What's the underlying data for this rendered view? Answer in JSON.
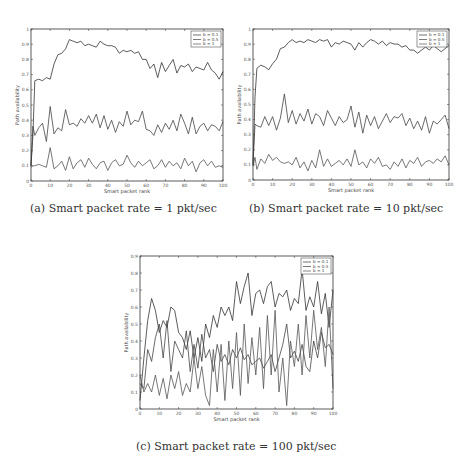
{
  "figures": [
    {
      "id": "a",
      "caption": "(a) Smart packet rate = 1 pkt/sec"
    },
    {
      "id": "b",
      "caption": "(b) Smart packet rate = 10 pkt/sec"
    },
    {
      "id": "c",
      "caption": "(c) Smart packet rate = 100 pkt/sec"
    }
  ],
  "chart_data": [
    {
      "type": "line",
      "title": "(a) Smart packet rate = 1 pkt/sec",
      "xlabel": "Smart packet rank",
      "ylabel": "Path availability",
      "xlim": [
        0,
        100
      ],
      "ylim": [
        0,
        1
      ],
      "xticks": [
        0,
        10,
        20,
        30,
        40,
        50,
        60,
        70,
        80,
        90,
        100
      ],
      "yticks": [
        0,
        0.1,
        0.2,
        0.3,
        0.4,
        0.5,
        0.6,
        0.7,
        0.8,
        0.9,
        1
      ],
      "grid": false,
      "legend_position": "upper right",
      "x": [
        0,
        1,
        2,
        4,
        6,
        8,
        10,
        12,
        14,
        16,
        18,
        20,
        22,
        24,
        26,
        28,
        30,
        32,
        34,
        36,
        38,
        40,
        42,
        44,
        46,
        48,
        50,
        52,
        54,
        56,
        58,
        60,
        62,
        64,
        66,
        68,
        70,
        72,
        74,
        76,
        78,
        80,
        82,
        84,
        86,
        88,
        90,
        92,
        94,
        96,
        98,
        100
      ],
      "series": [
        {
          "name": "b = 0.1",
          "values": [
            0.1,
            0.3,
            0.66,
            0.67,
            0.66,
            0.68,
            0.67,
            0.77,
            0.83,
            0.84,
            0.87,
            0.93,
            0.92,
            0.91,
            0.92,
            0.89,
            0.9,
            0.89,
            0.88,
            0.92,
            0.9,
            0.89,
            0.89,
            0.88,
            0.84,
            0.86,
            0.85,
            0.86,
            0.84,
            0.85,
            0.8,
            0.8,
            0.74,
            0.77,
            0.68,
            0.78,
            0.72,
            0.76,
            0.8,
            0.71,
            0.76,
            0.75,
            0.77,
            0.72,
            0.75,
            0.74,
            0.73,
            0.78,
            0.73,
            0.71,
            0.67,
            0.72
          ]
        },
        {
          "name": "b = 0.5",
          "values": [
            0.1,
            0.36,
            0.3,
            0.35,
            0.38,
            0.26,
            0.49,
            0.31,
            0.35,
            0.33,
            0.47,
            0.37,
            0.38,
            0.36,
            0.41,
            0.38,
            0.43,
            0.38,
            0.44,
            0.35,
            0.43,
            0.34,
            0.4,
            0.32,
            0.39,
            0.36,
            0.46,
            0.37,
            0.4,
            0.39,
            0.46,
            0.34,
            0.33,
            0.3,
            0.37,
            0.32,
            0.38,
            0.34,
            0.4,
            0.33,
            0.44,
            0.38,
            0.31,
            0.42,
            0.31,
            0.36,
            0.38,
            0.33,
            0.37,
            0.36,
            0.33,
            0.39
          ]
        },
        {
          "name": "b = 1",
          "values": [
            0.09,
            0.1,
            0.1,
            0.11,
            0.1,
            0.09,
            0.22,
            0.08,
            0.1,
            0.13,
            0.07,
            0.16,
            0.08,
            0.12,
            0.14,
            0.09,
            0.15,
            0.11,
            0.08,
            0.12,
            0.13,
            0.07,
            0.12,
            0.14,
            0.1,
            0.11,
            0.17,
            0.12,
            0.09,
            0.13,
            0.1,
            0.12,
            0.14,
            0.08,
            0.1,
            0.14,
            0.09,
            0.13,
            0.1,
            0.12,
            0.08,
            0.15,
            0.1,
            0.13,
            0.06,
            0.12,
            0.14,
            0.1,
            0.13,
            0.09,
            0.1,
            0.09
          ]
        }
      ]
    },
    {
      "type": "line",
      "title": "(b) Smart packet rate = 10 pkt/sec",
      "xlabel": "Smart packet rank",
      "ylabel": "Path availability",
      "xlim": [
        0,
        100
      ],
      "ylim": [
        0,
        1
      ],
      "xticks": [
        0,
        10,
        20,
        30,
        40,
        50,
        60,
        70,
        80,
        90,
        100
      ],
      "yticks": [
        0,
        0.1,
        0.2,
        0.3,
        0.4,
        0.5,
        0.6,
        0.7,
        0.8,
        0.9,
        1
      ],
      "grid": false,
      "legend_position": "upper right",
      "x": [
        0,
        1,
        2,
        4,
        6,
        8,
        10,
        12,
        14,
        16,
        18,
        20,
        22,
        24,
        26,
        28,
        30,
        32,
        34,
        36,
        38,
        40,
        42,
        44,
        46,
        48,
        50,
        52,
        54,
        56,
        58,
        60,
        62,
        64,
        66,
        68,
        70,
        72,
        74,
        76,
        78,
        80,
        82,
        84,
        86,
        88,
        90,
        92,
        94,
        96,
        98,
        100
      ],
      "series": [
        {
          "name": "b = 0.1",
          "values": [
            0.1,
            0.55,
            0.74,
            0.76,
            0.75,
            0.73,
            0.77,
            0.8,
            0.87,
            0.88,
            0.91,
            0.93,
            0.91,
            0.92,
            0.91,
            0.93,
            0.92,
            0.91,
            0.93,
            0.92,
            0.93,
            0.88,
            0.91,
            0.9,
            0.92,
            0.91,
            0.9,
            0.86,
            0.91,
            0.88,
            0.91,
            0.93,
            0.92,
            0.9,
            0.92,
            0.89,
            0.91,
            0.9,
            0.9,
            0.88,
            0.89,
            0.86,
            0.86,
            0.84,
            0.86,
            0.88,
            0.86,
            0.89,
            0.87,
            0.85,
            0.87,
            0.89
          ]
        },
        {
          "name": "b = 0.5",
          "values": [
            0.1,
            0.37,
            0.36,
            0.35,
            0.42,
            0.36,
            0.42,
            0.33,
            0.41,
            0.57,
            0.38,
            0.46,
            0.37,
            0.44,
            0.39,
            0.47,
            0.37,
            0.44,
            0.42,
            0.36,
            0.46,
            0.41,
            0.36,
            0.42,
            0.38,
            0.4,
            0.49,
            0.35,
            0.45,
            0.31,
            0.43,
            0.36,
            0.42,
            0.34,
            0.39,
            0.44,
            0.38,
            0.42,
            0.41,
            0.44,
            0.36,
            0.41,
            0.34,
            0.39,
            0.33,
            0.42,
            0.31,
            0.39,
            0.37,
            0.4,
            0.43,
            0.34
          ]
        },
        {
          "name": "b = 1",
          "values": [
            0.09,
            0.15,
            0.07,
            0.14,
            0.11,
            0.17,
            0.13,
            0.15,
            0.12,
            0.11,
            0.12,
            0.1,
            0.15,
            0.08,
            0.12,
            0.06,
            0.13,
            0.08,
            0.2,
            0.09,
            0.14,
            0.09,
            0.11,
            0.13,
            0.1,
            0.14,
            0.09,
            0.2,
            0.1,
            0.12,
            0.08,
            0.14,
            0.11,
            0.15,
            0.09,
            0.1,
            0.07,
            0.12,
            0.09,
            0.14,
            0.08,
            0.13,
            0.11,
            0.15,
            0.09,
            0.12,
            0.13,
            0.11,
            0.14,
            0.12,
            0.16,
            0.1
          ]
        }
      ]
    },
    {
      "type": "line",
      "title": "(c) Smart packet rate = 100 pkt/sec",
      "xlabel": "Smart packet rank",
      "ylabel": "Path availability",
      "xlim": [
        0,
        100
      ],
      "ylim": [
        0,
        0.9
      ],
      "xticks": [
        0,
        10,
        20,
        30,
        40,
        50,
        60,
        70,
        80,
        90,
        100
      ],
      "yticks": [
        0,
        0.1,
        0.2,
        0.3,
        0.4,
        0.5,
        0.6,
        0.7,
        0.8,
        0.9
      ],
      "grid": false,
      "legend_position": "upper right",
      "x": [
        0,
        2,
        4,
        6,
        8,
        10,
        12,
        14,
        16,
        18,
        20,
        22,
        24,
        26,
        28,
        30,
        32,
        34,
        36,
        38,
        40,
        42,
        44,
        46,
        48,
        50,
        52,
        54,
        56,
        58,
        60,
        62,
        64,
        66,
        68,
        70,
        72,
        74,
        76,
        78,
        80,
        82,
        84,
        86,
        88,
        90,
        92,
        94,
        96,
        98,
        100
      ],
      "series": [
        {
          "name": "b = 0.1",
          "values": [
            0.05,
            0.3,
            0.52,
            0.65,
            0.58,
            0.45,
            0.52,
            0.48,
            0.6,
            0.58,
            0.45,
            0.42,
            0.35,
            0.46,
            0.3,
            0.42,
            0.28,
            0.5,
            0.42,
            0.55,
            0.48,
            0.6,
            0.55,
            0.6,
            0.52,
            0.75,
            0.62,
            0.72,
            0.8,
            0.55,
            0.68,
            0.7,
            0.62,
            0.72,
            0.75,
            0.6,
            0.68,
            0.66,
            0.7,
            0.58,
            0.65,
            0.62,
            0.82,
            0.58,
            0.66,
            0.6,
            0.75,
            0.56,
            0.68,
            0.48,
            0.7
          ]
        },
        {
          "name": "b = 0.5",
          "values": [
            0.15,
            0.12,
            0.35,
            0.28,
            0.42,
            0.5,
            0.3,
            0.52,
            0.22,
            0.4,
            0.35,
            0.3,
            0.46,
            0.22,
            0.38,
            0.24,
            0.44,
            0.3,
            0.35,
            0.22,
            0.38,
            0.28,
            0.32,
            0.26,
            0.35,
            0.3,
            0.36,
            0.29,
            0.32,
            0.26,
            0.28,
            0.3,
            0.24,
            0.28,
            0.32,
            0.22,
            0.3,
            0.38,
            0.5,
            0.3,
            0.34,
            0.28,
            0.38,
            0.25,
            0.22,
            0.4,
            0.3,
            0.45,
            0.36,
            0.38,
            0.32
          ]
        },
        {
          "name": "b = 1",
          "values": [
            0.2,
            0.1,
            0.15,
            0.1,
            0.2,
            0.08,
            0.18,
            0.06,
            0.2,
            0.12,
            0.22,
            0.08,
            0.15,
            0.1,
            0.3,
            0.12,
            0.25,
            0.08,
            0.02,
            0.35,
            0.1,
            0.38,
            0.05,
            0.4,
            0.12,
            0.45,
            0.08,
            0.5,
            0.15,
            0.42,
            0.2,
            0.48,
            0.12,
            0.55,
            0.2,
            0.58,
            0.1,
            0.3,
            0.02,
            0.4,
            0.25,
            0.5,
            0.2,
            0.55,
            0.3,
            0.58,
            0.35,
            0.48,
            0.25,
            0.6,
            0.12
          ]
        }
      ]
    }
  ]
}
